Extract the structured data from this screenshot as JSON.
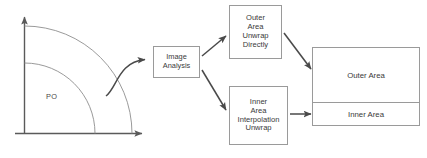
{
  "diagram": {
    "colors": {
      "stroke": "#9a9a9a",
      "axis": "#5a5a5a",
      "arc": "#8f8f8f",
      "arrow": "#4a4a4a",
      "text": "#3a3a3a",
      "background": "#ffffff"
    },
    "source_plot": {
      "region_label": "PO",
      "axis_vertical_name": "vertical-axis",
      "axis_horizontal_name": "horizontal-axis",
      "arcs": 2
    },
    "nodes": [
      {
        "id": "image-analysis",
        "label": "Image\nAnalysis"
      },
      {
        "id": "outer-area-unwrap-directly",
        "label": "Outer\nArea\nUnwrap\nDirectly"
      },
      {
        "id": "inner-area-interpolation-unwrap",
        "label": "Inner\nArea\nInterpolation\nUnwrap"
      },
      {
        "id": "outer-area",
        "label": "Outer Area"
      },
      {
        "id": "inner-area",
        "label": "Inner Area"
      }
    ],
    "edges": [
      {
        "from": "source-plot",
        "to": "image-analysis",
        "style": "curved"
      },
      {
        "from": "image-analysis",
        "to": "outer-area-unwrap-directly",
        "style": "straight"
      },
      {
        "from": "image-analysis",
        "to": "inner-area-interpolation-unwrap",
        "style": "straight"
      },
      {
        "from": "outer-area-unwrap-directly",
        "to": "outer-area",
        "style": "straight"
      },
      {
        "from": "inner-area-interpolation-unwrap",
        "to": "inner-area",
        "style": "straight"
      }
    ]
  }
}
